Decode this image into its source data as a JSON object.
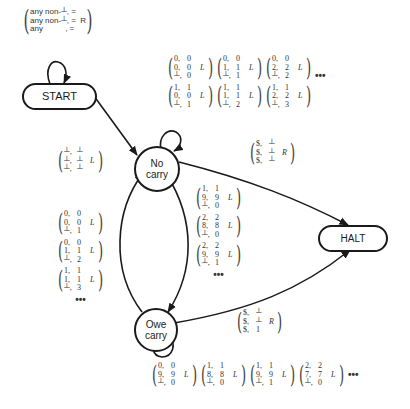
{
  "diagram": {
    "nodes": {
      "start": {
        "label": "START"
      },
      "no_carry": {
        "label_line1": "No",
        "label_line2": "carry"
      },
      "owe_carry": {
        "label_line1": "Owe",
        "label_line2": "carry"
      },
      "halt": {
        "label": "HALT"
      }
    },
    "start_loop": {
      "rows": [
        {
          "a": "any non-┴,",
          "b": "=",
          "dir": ""
        },
        {
          "a": "any non-┴,",
          "b": "=",
          "dir": "R"
        },
        {
          "a": "any",
          "b": ",  =",
          "dir": ""
        }
      ],
      "r0": "any non-┴, =",
      "r1": "any non-┴, =  R",
      "r2": "any          , ="
    },
    "start_to_nocarry": {
      "m0": {
        "r0a": "┴,",
        "r0b": "┴",
        "r1a": "┴,",
        "r1b": "┴",
        "r2a": "┴,",
        "r2b": "┴",
        "dir": "L"
      }
    },
    "nocarry_loop": {
      "matrices": [
        {
          "r0a": "0,",
          "r0b": "0",
          "r1a": "0,",
          "r1b": "0",
          "r2a": "┴,",
          "r2b": "0",
          "dir": "L"
        },
        {
          "r0a": "0,",
          "r0b": "0",
          "r1a": "1,",
          "r1b": "1",
          "r2a": "┴,",
          "r2b": "1",
          "dir": "L"
        },
        {
          "r0a": "0,",
          "r0b": "0",
          "r1a": "2,",
          "r1b": "2",
          "r2a": "┴,",
          "r2b": "2",
          "dir": "L"
        },
        {
          "r0a": "1,",
          "r0b": "1",
          "r1a": "0,",
          "r1b": "0",
          "r2a": "┴,",
          "r2b": "1",
          "dir": "L"
        },
        {
          "r0a": "1,",
          "r0b": "1",
          "r1a": "1,",
          "r1b": "1",
          "r2a": "┴,",
          "r2b": "2",
          "dir": "L"
        },
        {
          "r0a": "1,",
          "r0b": "1",
          "r1a": "2,",
          "r1b": "2",
          "r2a": "┴,",
          "r2b": "3",
          "dir": "L"
        }
      ],
      "ellipsis": "•••"
    },
    "nocarry_to_halt": {
      "m0": {
        "r0a": "$,",
        "r0b": "┴",
        "r1a": "$,",
        "r1b": "┴",
        "r2a": "$,",
        "r2b": "┴",
        "dir": "R"
      }
    },
    "owecarry_to_nocarry": {
      "matrices": [
        {
          "r0a": "0,",
          "r0b": "0",
          "r1a": "0,",
          "r1b": "0",
          "r2a": "┴,",
          "r2b": "1",
          "dir": "L"
        },
        {
          "r0a": "0,",
          "r0b": "0",
          "r1a": "1,",
          "r1b": "1",
          "r2a": "┴,",
          "r2b": "2",
          "dir": "L"
        },
        {
          "r0a": "1,",
          "r0b": "1",
          "r1a": "1,",
          "r1b": "1",
          "r2a": "┴,",
          "r2b": "3",
          "dir": "L"
        }
      ],
      "ellipsis": "•••"
    },
    "nocarry_to_owecarry": {
      "matrices": [
        {
          "r0a": "1,",
          "r0b": "1",
          "r1a": "9,",
          "r1b": "9",
          "r2a": "┴,",
          "r2b": "0",
          "dir": "L"
        },
        {
          "r0a": "2,",
          "r0b": "2",
          "r1a": "8,",
          "r1b": "8",
          "r2a": "┴,",
          "r2b": "0",
          "dir": "L"
        },
        {
          "r0a": "2,",
          "r0b": "2",
          "r1a": "9,",
          "r1b": "9",
          "r2a": "┴,",
          "r2b": "1",
          "dir": "L"
        }
      ],
      "ellipsis": "•••"
    },
    "owecarry_to_halt": {
      "m0": {
        "r0a": "$,",
        "r0b": "┴",
        "r1a": "$,",
        "r1b": "┴",
        "r2a": "$,",
        "r2b": "1",
        "dir": "R"
      }
    },
    "owecarry_loop": {
      "matrices": [
        {
          "r0a": "0,",
          "r0b": "0",
          "r1a": "9,",
          "r1b": "9",
          "r2a": "┴,",
          "r2b": "0",
          "dir": "L"
        },
        {
          "r0a": "1,",
          "r0b": "1",
          "r1a": "8,",
          "r1b": "8",
          "r2a": "┴,",
          "r2b": "0",
          "dir": "L"
        },
        {
          "r0a": "1,",
          "r0b": "1",
          "r1a": "9,",
          "r1b": "9",
          "r2a": "┴,",
          "r2b": "1",
          "dir": "L"
        },
        {
          "r0a": "2,",
          "r0b": "2",
          "r1a": "7,",
          "r1b": "7",
          "r2a": "┴,",
          "r2b": "0",
          "dir": "L"
        }
      ],
      "ellipsis": "•••"
    },
    "colors": {
      "stroke": "#1a1a1a",
      "text": "#333333",
      "background": "#ffffff"
    }
  }
}
